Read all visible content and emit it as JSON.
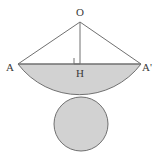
{
  "figure": {
    "kind": "geometry-diagram",
    "background_color": "#ffffff",
    "fill_color": "#d2d2d2",
    "stroke_color": "#707070",
    "label_color": "#3a3a3a",
    "stroke_width": 1,
    "labels": {
      "apex": "O",
      "left_endpoint": "A",
      "right_endpoint": "A'",
      "foot": "H"
    },
    "points": {
      "O": {
        "x": 80,
        "y": 22
      },
      "A": {
        "x": 18,
        "y": 64
      },
      "A_prime": {
        "x": 141,
        "y": 64
      },
      "H": {
        "x": 80,
        "y": 64
      }
    },
    "label_positions": {
      "O": {
        "x": 80,
        "y": 13
      },
      "A": {
        "x": 10,
        "y": 68
      },
      "A_prime": {
        "x": 147,
        "y": 68
      },
      "H": {
        "x": 80,
        "y": 74
      }
    },
    "arc": {
      "chord_y": 64,
      "sagitta_bottom_y": 92,
      "radius": 77,
      "sweep_flag": 0
    },
    "right_angle_marker": {
      "x": 74,
      "y": 58,
      "size": 6
    },
    "circle": {
      "center_x": 81,
      "center_y": 124,
      "radius": 27
    }
  }
}
